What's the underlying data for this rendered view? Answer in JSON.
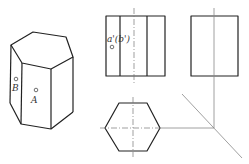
{
  "figure": {
    "type": "orthographic projection of hexagonal prism",
    "isometric_view": {
      "points": [
        {
          "name": "B",
          "label": "B"
        },
        {
          "name": "A",
          "label": "A"
        }
      ]
    },
    "front_view": {
      "point_label": "a'(b')"
    },
    "side_view": {},
    "top_view": {},
    "colors": {
      "edge": "#222222",
      "construction": "#888888",
      "background": "#ffffff"
    }
  }
}
